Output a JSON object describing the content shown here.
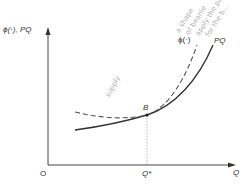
{
  "diagram": {
    "y_axis_label": "ϕ(·), PQ",
    "x_axis_label": "Q",
    "origin_label": "O",
    "x_marker_label": "Q*",
    "point_label": "B",
    "curves": [
      {
        "name": "PQ",
        "label": "PQ",
        "style": "solid"
      },
      {
        "name": "phi",
        "label": "ϕ(·)",
        "style": "dashed"
      }
    ],
    "annotations": {
      "supply_note": "supply",
      "margin_note_lines": [
        "a shape",
        "of beanie",
        "apply the pat",
        "for the b..."
      ]
    },
    "colors": {
      "line": "#333333",
      "dashed": "#555555",
      "handwriting": "#b0b0b0"
    }
  }
}
